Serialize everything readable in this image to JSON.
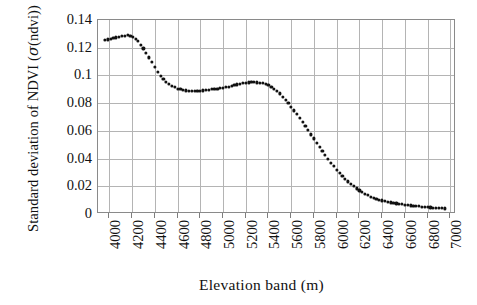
{
  "chart_data": {
    "type": "scatter",
    "title": "",
    "xlabel": "Elevation band (m)",
    "ylabel": "Standard deviation of NDVI (σ(ndvi))",
    "ylabel_prefix": "Standard deviation of NDVI (",
    "ylabel_symbol": "σ",
    "ylabel_suffix": "(ndvi))",
    "xlim": [
      3900,
      7050
    ],
    "ylim": [
      0,
      0.14
    ],
    "grid": true,
    "legend": "none",
    "marker": "square-dot",
    "marker_color": "#111111",
    "xticks": [
      4000,
      4200,
      4400,
      4600,
      4800,
      5000,
      5200,
      5400,
      5600,
      5800,
      6000,
      6200,
      6400,
      6600,
      6800,
      7000
    ],
    "xtick_labels": [
      "4000",
      "4200",
      "4400",
      "4600",
      "4800",
      "5000",
      "5200",
      "5400",
      "5600",
      "5800",
      "6000",
      "6200",
      "6400",
      "6600",
      "6800",
      "7000"
    ],
    "yticks": [
      0,
      0.02,
      0.04,
      0.06,
      0.08,
      0.1,
      0.12,
      0.14
    ],
    "ytick_labels": [
      "0",
      "0.02",
      "0.04",
      "0.06",
      "0.08",
      "0.1",
      "0.12",
      "0.14"
    ],
    "x": [
      3960,
      4010,
      4060,
      4110,
      4160,
      4210,
      4250,
      4300,
      4350,
      4400,
      4450,
      4500,
      4550,
      4600,
      4650,
      4700,
      4750,
      4800,
      4850,
      4900,
      4950,
      5000,
      5050,
      5100,
      5150,
      5200,
      5250,
      5300,
      5350,
      5400,
      5450,
      5500,
      5550,
      5600,
      5650,
      5700,
      5750,
      5800,
      5850,
      5900,
      5950,
      6000,
      6050,
      6100,
      6150,
      6200,
      6250,
      6300,
      6350,
      6400,
      6450,
      6500,
      6550,
      6600,
      6650,
      6700,
      6750,
      6800,
      6850,
      6900,
      6950
    ],
    "y": [
      0.1255,
      0.1265,
      0.1275,
      0.1285,
      0.129,
      0.128,
      0.125,
      0.1195,
      0.113,
      0.106,
      0.0995,
      0.0955,
      0.0925,
      0.0905,
      0.0895,
      0.089,
      0.0888,
      0.089,
      0.0895,
      0.09,
      0.0905,
      0.0912,
      0.092,
      0.093,
      0.094,
      0.0948,
      0.0952,
      0.095,
      0.0945,
      0.093,
      0.0905,
      0.087,
      0.0825,
      0.0775,
      0.072,
      0.0665,
      0.0605,
      0.0545,
      0.0485,
      0.0425,
      0.037,
      0.032,
      0.0275,
      0.0235,
      0.02,
      0.017,
      0.0145,
      0.0125,
      0.011,
      0.0098,
      0.0088,
      0.008,
      0.0074,
      0.0068,
      0.0062,
      0.0058,
      0.0054,
      0.005,
      0.0046,
      0.0043,
      0.004
    ],
    "series_name": "sigma(ndvi) vs elevation band"
  }
}
